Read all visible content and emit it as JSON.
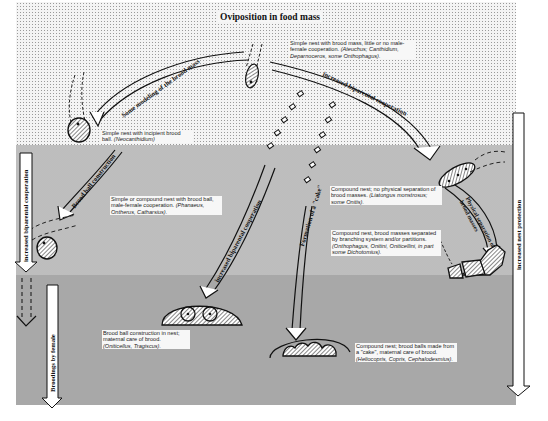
{
  "title": "Oviposition in food mass",
  "bands": [
    {
      "name": "top",
      "color": "#f4f4f4",
      "pattern": "dots"
    },
    {
      "name": "middle",
      "color": "#e6e6e6",
      "pattern": "fine-halftone"
    },
    {
      "name": "bottom",
      "color": "#c9c9c9",
      "pattern": "halftone"
    }
  ],
  "arrows": {
    "modeling": "Some modeling of the brood mass",
    "biparental_top": "increased biparental cooperation",
    "cake": "Formation of a \"cake\"",
    "ball": "Brood ball construction",
    "biparental_mid": "increased biparental cooperation",
    "physical": "Physical separation of brood masses",
    "left_vertical": "increased biparental cooperation",
    "broodings": "Broodings by female",
    "right_vertical": "increased nest protection"
  },
  "notes": {
    "n1": {
      "text": "Simple nest with brood mass, little or no male-female cooperation. ",
      "species": "(Ateuchus; Canthidium, Deparnoceros, some Onthophagus)."
    },
    "n2": {
      "text": "Simple nest with incipient brood ball. ",
      "species": "(Neocanthidium)"
    },
    "n3": {
      "text": "Simple or compound nest with brood ball, male-female cooperation. ",
      "species": "(Phanaeus, Ontherus, Catharsius)."
    },
    "n4": {
      "text": "Compound nest; no physical separation of brood masses. ",
      "species": "(Liatongus monstrosus; some Onitis)."
    },
    "n5": {
      "text": "Compound nest, brood masses separated by branching system and/or partitions. ",
      "species": "(Onthophagus, Onitini, Oniticellini, in part some Dichotomius)."
    },
    "n6": {
      "text": "Brood ball construction in nest; maternal care of brood. ",
      "species": "(Oniticellus, Tragiscus)."
    },
    "n7": {
      "text": "Compound nest; brood balls made from a \"cake\", maternal care of brood. ",
      "species": "(Heliocopris, Copris, Cephalodesmius)."
    }
  }
}
